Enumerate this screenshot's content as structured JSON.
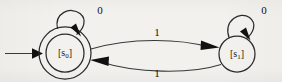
{
  "diagram": {
    "type": "finite-state-automaton",
    "background_color": "#f2f1ee",
    "ink_color": "#2b2b2b",
    "states": [
      {
        "id": "s0",
        "label": "[s",
        "subscript": "0",
        "label_close": "]",
        "shape": "double-circle",
        "accepting": true,
        "initial": true,
        "cx": 65,
        "cy": 53,
        "r_outer": 26,
        "r_inner": 19
      },
      {
        "id": "s1",
        "label": "[s",
        "subscript": "1",
        "label_close": "]",
        "shape": "circle",
        "accepting": false,
        "initial": false,
        "cx": 237,
        "cy": 54,
        "r_outer": 18,
        "r_inner": 0
      }
    ],
    "transitions": [
      {
        "id": "start-arrow",
        "from": "",
        "to": "s0",
        "label": "",
        "kind": "initial-marker"
      },
      {
        "id": "s0-self",
        "from": "s0",
        "to": "s0",
        "label": "0",
        "kind": "self-loop",
        "label_x": 100,
        "label_y": 11
      },
      {
        "id": "s1-self",
        "from": "s1",
        "to": "s1",
        "label": "0",
        "kind": "self-loop",
        "label_x": 264,
        "label_y": 11
      },
      {
        "id": "s0-to-s1",
        "from": "s0",
        "to": "s1",
        "label": "1",
        "kind": "arc-upper",
        "label_x": 157,
        "label_y": 33
      },
      {
        "id": "s1-to-s0",
        "from": "s1",
        "to": "s0",
        "label": "1",
        "kind": "arc-lower",
        "label_x": 157,
        "label_y": 74
      }
    ],
    "alphabet": [
      "0",
      "1"
    ]
  }
}
